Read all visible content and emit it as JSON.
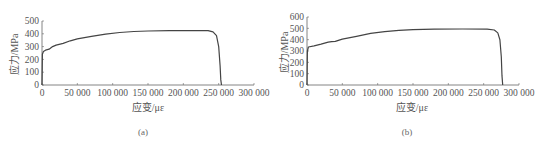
{
  "chart_data": [
    {
      "type": "line",
      "title": "",
      "caption": "(a)",
      "xlabel": "应变/με",
      "ylabel": "应力/MPa",
      "xlim": [
        0,
        300000
      ],
      "ylim": [
        0,
        500
      ],
      "xticks": [
        "0",
        "50 000",
        "100 000",
        "150 000",
        "200 000",
        "250 000",
        "300 000"
      ],
      "yticks": [
        "0",
        "100",
        "200",
        "300",
        "400",
        "500"
      ],
      "grid": false,
      "series": [
        {
          "name": "stress-strain (a)",
          "x": [
            0,
            500,
            2000,
            5000,
            10000,
            15000,
            20000,
            30000,
            40000,
            50000,
            70000,
            90000,
            110000,
            130000,
            150000,
            180000,
            210000,
            235000,
            242000,
            247000,
            250000,
            252000,
            253000,
            254000
          ],
          "y": [
            0,
            240,
            262,
            272,
            280,
            300,
            312,
            325,
            345,
            360,
            380,
            398,
            410,
            418,
            422,
            424,
            425,
            424,
            415,
            385,
            300,
            150,
            40,
            0
          ]
        }
      ]
    },
    {
      "type": "line",
      "title": "",
      "caption": "(b)",
      "xlabel": "应变/με",
      "ylabel": "应力/MPa",
      "xlim": [
        0,
        300000
      ],
      "ylim": [
        0,
        600
      ],
      "xticks": [
        "0",
        "50 000",
        "100 000",
        "150 000",
        "200 000",
        "250 000",
        "300 000"
      ],
      "yticks": [
        "0",
        "100",
        "200",
        "300",
        "400",
        "500",
        "600"
      ],
      "grid": false,
      "series": [
        {
          "name": "stress-strain (b)",
          "x": [
            0,
            500,
            2000,
            10000,
            20000,
            30000,
            35000,
            40000,
            50000,
            70000,
            90000,
            110000,
            130000,
            150000,
            180000,
            220000,
            255000,
            265000,
            270000,
            273000,
            275000,
            276000,
            277000
          ],
          "y": [
            0,
            300,
            335,
            345,
            360,
            378,
            382,
            385,
            405,
            430,
            455,
            470,
            482,
            488,
            492,
            494,
            493,
            485,
            460,
            400,
            250,
            80,
            0
          ]
        }
      ]
    }
  ]
}
